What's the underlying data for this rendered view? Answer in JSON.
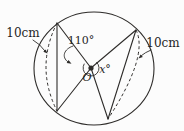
{
  "figure": {
    "background_color": "#fcfcfc",
    "line_color": "#2e2c2a",
    "text_color": "#1f1f1f",
    "labels": {
      "left_measure": "10cm",
      "right_measure": "10cm",
      "center_angle": "110°",
      "unknown_angle": "x°",
      "center_point": "O"
    }
  }
}
